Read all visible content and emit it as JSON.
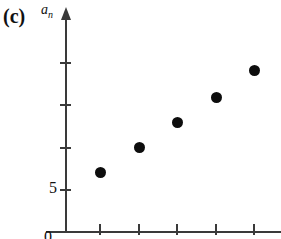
{
  "figure": {
    "panel_label": "(c)",
    "y_axis_label_base": "a",
    "y_axis_label_sub": "n",
    "origin_label": "0",
    "point_color": "#0d0d0d",
    "axis_color": "#3a3a3a",
    "background_color": "#ffffff"
  },
  "chart_data": {
    "type": "scatter",
    "title": "(c)",
    "xlabel": "",
    "ylabel": "a_n",
    "x": [
      1,
      2,
      3,
      4,
      5
    ],
    "values": [
      5.4,
      6.0,
      6.6,
      7.2,
      7.8
    ],
    "series": [
      {
        "name": "a_n",
        "values": [
          5.4,
          6.0,
          6.6,
          7.2,
          7.8
        ]
      }
    ],
    "ylim": [
      0,
      8.4
    ],
    "xlim": [
      0,
      5.7
    ],
    "y_tick_values": [
      5,
      6,
      7,
      8
    ],
    "y_tick_labels": [
      "5",
      "",
      "",
      ""
    ],
    "x_tick_values": [
      1,
      2,
      3,
      4,
      5
    ],
    "x_tick_labels": [
      "",
      "",
      "",
      "",
      ""
    ],
    "grid": false,
    "legend": false,
    "axis_arrows": [
      "y-up"
    ]
  },
  "y_ticks": [
    {
      "label": "",
      "top": 62
    },
    {
      "label": "",
      "top": 104
    },
    {
      "label": "",
      "top": 147
    },
    {
      "label": "5",
      "top": 189
    }
  ],
  "x_ticks": [
    {
      "label": "",
      "left": 99
    },
    {
      "label": "",
      "left": 138
    },
    {
      "label": "",
      "left": 176
    },
    {
      "label": "",
      "left": 215
    },
    {
      "label": "",
      "left": 253
    }
  ],
  "points": [
    {
      "name": "point-1",
      "left": 100,
      "top": 172
    },
    {
      "name": "point-2",
      "left": 139,
      "top": 147
    },
    {
      "name": "point-3",
      "left": 177,
      "top": 122
    },
    {
      "name": "point-4",
      "left": 216,
      "top": 97
    },
    {
      "name": "point-5",
      "left": 254,
      "top": 70
    }
  ]
}
